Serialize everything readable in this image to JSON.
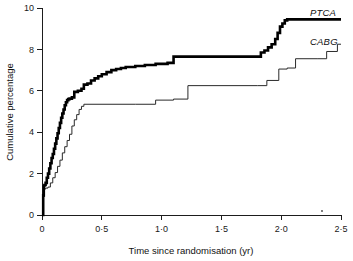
{
  "chart_data": {
    "type": "line",
    "title": "",
    "subtitle": "",
    "xlabel": "Time since randomisation (yr)",
    "ylabel": "Cumulative percentage",
    "xlim": [
      0,
      2.5
    ],
    "ylim": [
      0,
      10
    ],
    "grid": false,
    "legend_position": "right-inline",
    "xticks": [
      0,
      0.5,
      1.0,
      1.5,
      2.0,
      2.5
    ],
    "xtick_labels": [
      "0",
      "0·5",
      "1·0",
      "1·5",
      "2·0",
      "2·5"
    ],
    "yticks": [
      0,
      2,
      4,
      6,
      8,
      10
    ],
    "ytick_labels": [
      "0",
      "2",
      "4",
      "6",
      "8",
      "10"
    ],
    "note": "Kaplan-Meier style cumulative-incidence step curves for two treatment arms",
    "series": [
      {
        "name": "PTCA",
        "label": "PTCA",
        "style": "thick-step",
        "color": "#000000",
        "final_value": 9.45,
        "x": [
          0.0,
          0.01,
          0.015,
          0.02,
          0.03,
          0.04,
          0.05,
          0.06,
          0.07,
          0.08,
          0.09,
          0.1,
          0.11,
          0.12,
          0.13,
          0.14,
          0.15,
          0.16,
          0.17,
          0.18,
          0.19,
          0.2,
          0.21,
          0.22,
          0.23,
          0.25,
          0.27,
          0.3,
          0.33,
          0.35,
          0.38,
          0.41,
          0.44,
          0.47,
          0.5,
          0.54,
          0.58,
          0.62,
          0.66,
          0.7,
          0.78,
          0.86,
          0.95,
          1.05,
          1.1,
          1.8,
          1.83,
          1.86,
          1.89,
          1.92,
          1.95,
          1.97,
          1.99,
          2.01,
          2.03,
          2.05,
          2.5
        ],
        "y": [
          0.0,
          0.95,
          1.4,
          1.45,
          1.55,
          1.8,
          2.0,
          2.25,
          2.5,
          2.75,
          2.95,
          3.2,
          3.45,
          3.7,
          3.95,
          4.2,
          4.45,
          4.7,
          4.9,
          5.1,
          5.3,
          5.45,
          5.55,
          5.6,
          5.62,
          5.68,
          5.95,
          6.0,
          6.1,
          6.3,
          6.35,
          6.5,
          6.6,
          6.7,
          6.8,
          6.9,
          7.0,
          7.05,
          7.1,
          7.15,
          7.2,
          7.25,
          7.3,
          7.35,
          7.65,
          7.65,
          7.85,
          7.95,
          8.1,
          8.25,
          8.5,
          8.8,
          9.1,
          9.25,
          9.4,
          9.45,
          9.45
        ]
      },
      {
        "name": "CABG",
        "label": "CABG",
        "style": "thin-step",
        "color": "#2a2a2a",
        "final_value": 8.25,
        "x": [
          0.0,
          0.01,
          0.02,
          0.03,
          0.05,
          0.07,
          0.09,
          0.11,
          0.13,
          0.15,
          0.17,
          0.19,
          0.21,
          0.23,
          0.25,
          0.27,
          0.29,
          0.31,
          0.33,
          0.35,
          0.78,
          0.95,
          1.1,
          1.22,
          1.8,
          1.88,
          1.98,
          2.05,
          2.12,
          2.3,
          2.38,
          2.47,
          2.5
        ],
        "y": [
          0.0,
          0.9,
          1.25,
          1.3,
          1.35,
          1.55,
          1.8,
          2.05,
          2.35,
          2.65,
          3.0,
          3.3,
          3.6,
          3.9,
          4.3,
          4.6,
          4.85,
          5.1,
          5.25,
          5.35,
          5.35,
          5.55,
          5.6,
          6.25,
          6.25,
          6.5,
          7.05,
          7.1,
          7.55,
          7.55,
          7.9,
          8.25,
          8.25
        ]
      }
    ]
  },
  "labels": {
    "ptca_annotation": "PTCA",
    "cabg_annotation": "CABG"
  }
}
